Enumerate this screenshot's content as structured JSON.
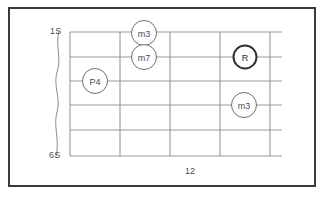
{
  "diagram": {
    "kind": "guitar-fretboard-chord-diagram",
    "top_string_label": "1S",
    "bottom_string_label": "6S",
    "fret_position_label": "12",
    "colors": {
      "frame": "#3a3a3c",
      "grid": "#9a9a9d",
      "marker_stroke": "#6f6f72",
      "root_marker_stroke": "#313134",
      "text": "#4d4d50",
      "background": "#ffffff"
    },
    "grid": {
      "strings": 6,
      "frets": 5,
      "string_labels": [
        "1S",
        "2S",
        "3S",
        "4S",
        "5S",
        "6S"
      ]
    },
    "markers": [
      {
        "label": "m3",
        "string": 1,
        "emphasis": "normal"
      },
      {
        "label": "m7",
        "string": 2,
        "emphasis": "normal"
      },
      {
        "label": "P4",
        "string": 3,
        "emphasis": "normal"
      },
      {
        "label": "R",
        "string": 2,
        "emphasis": "root"
      },
      {
        "label": "m3",
        "string": 4,
        "emphasis": "normal"
      }
    ]
  }
}
